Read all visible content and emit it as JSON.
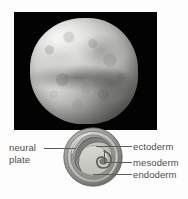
{
  "figure": {
    "background_color": "#fdfdfd",
    "photo": {
      "name": "embryo-photograph",
      "background_color": "#030303",
      "subject": "whole embryo sphere, grayscale light micrograph"
    },
    "cross_section": {
      "name": "embryo-cross-section-diagram",
      "description": "circular transverse section showing three concentric germ layers and neural plate infolding",
      "layer_colors": {
        "outer_ring": "#8f8f8c",
        "ectoderm": "#b9b9b5",
        "mesoderm": "#9c9c98",
        "endoderm": "#c9c9c4",
        "yolk_mass": "#cfcfca",
        "archenteron": "#7d7d7a"
      }
    }
  },
  "labels": {
    "neural_plate_line1": "neural",
    "neural_plate_line2": "plate",
    "ectoderm": "ectoderm",
    "mesoderm": "mesoderm",
    "endoderm": "endoderm"
  },
  "label_color": "#4b4b4b",
  "leader_line_color": "#5a5a5a"
}
